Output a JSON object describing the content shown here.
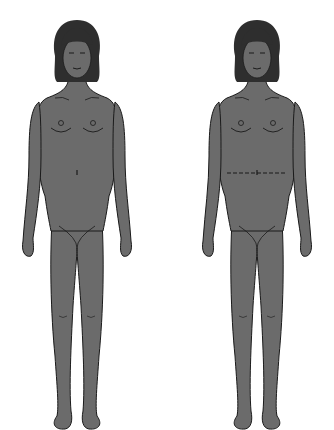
{
  "figure": {
    "panels": [
      {
        "id": "left",
        "description": "female body front view",
        "marking": "none"
      },
      {
        "id": "right",
        "description": "female body front view",
        "marking": "dashed line across waist"
      }
    ],
    "colors": {
      "skin": "#6b6b6b",
      "hair": "#2e2e2e",
      "outline": "#1a1a1a",
      "background": "#ffffff"
    }
  }
}
